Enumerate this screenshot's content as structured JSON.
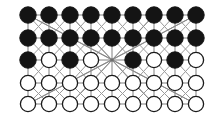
{
  "figure": {
    "type": "lattice-diagram",
    "columns": 9,
    "rows": 5,
    "node_states_legend": {
      "filled": "occupied / spin-up site",
      "open": "empty / spin-down site",
      "hub": "edge crossing point (no site marker)"
    },
    "colors": {
      "background": "#ffffff",
      "filled_node": "#141414",
      "open_node_fill": "#ffffff",
      "open_node_stroke": "#1a1a1a",
      "edge": "#8a8a8a",
      "diagonal_edge": "#9b9b9b"
    },
    "geometry": {
      "x_start": 28,
      "x_step": 21.0,
      "y_rows": [
        15,
        38,
        60,
        83,
        104
      ],
      "node_radius_filled": 8.2,
      "node_radius_open": 7.6,
      "hub_column": 5,
      "hub_row": 3
    },
    "grid": [
      [
        "filled",
        "filled",
        "filled",
        "filled",
        "filled",
        "filled",
        "filled",
        "filled",
        "filled"
      ],
      [
        "filled",
        "filled",
        "filled",
        "filled",
        "filled",
        "filled",
        "filled",
        "filled",
        "filled"
      ],
      [
        "filled",
        "open",
        "filled",
        "open",
        "hub",
        "filled",
        "open",
        "filled",
        "open"
      ],
      [
        "open",
        "open",
        "open",
        "open",
        "open",
        "open",
        "open",
        "open",
        "open"
      ],
      [
        "open",
        "open",
        "open",
        "open",
        "open",
        "open",
        "open",
        "open",
        "open"
      ]
    ]
  }
}
